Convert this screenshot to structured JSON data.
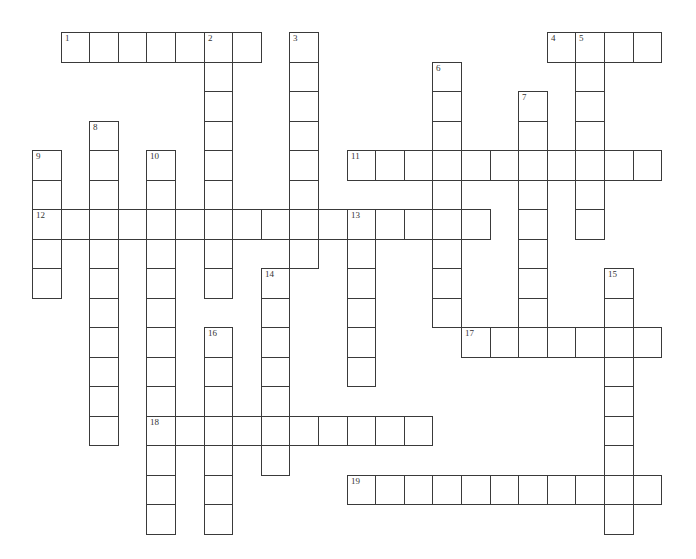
{
  "puzzle": {
    "title": "",
    "grid": {
      "origin_x": 32,
      "origin_y": 32,
      "cell_w": 28.6,
      "cell_h": 29.5,
      "line_color": "#3a3a3a",
      "cell_fill": "#ffffff"
    },
    "words": [
      {
        "number": "1",
        "direction": "across",
        "row": 0,
        "col": 1,
        "length": 7
      },
      {
        "number": "2",
        "direction": "down",
        "row": 0,
        "col": 6,
        "length": 9
      },
      {
        "number": "3",
        "direction": "down",
        "row": 0,
        "col": 9,
        "length": 8
      },
      {
        "number": "4",
        "direction": "across",
        "row": 0,
        "col": 18,
        "length": 4
      },
      {
        "number": "5",
        "direction": "down",
        "row": 0,
        "col": 19,
        "length": 7
      },
      {
        "number": "6",
        "direction": "down",
        "row": 1,
        "col": 14,
        "length": 9
      },
      {
        "number": "7",
        "direction": "down",
        "row": 2,
        "col": 17,
        "length": 8
      },
      {
        "number": "8",
        "direction": "down",
        "row": 3,
        "col": 2,
        "length": 11
      },
      {
        "number": "9",
        "direction": "down",
        "row": 4,
        "col": 0,
        "length": 5
      },
      {
        "number": "10",
        "direction": "down",
        "row": 4,
        "col": 4,
        "length": 13
      },
      {
        "number": "11",
        "direction": "across",
        "row": 4,
        "col": 11,
        "length": 11
      },
      {
        "number": "12",
        "direction": "across",
        "row": 6,
        "col": 0,
        "length": 16
      },
      {
        "number": "13",
        "direction": "down",
        "row": 6,
        "col": 11,
        "length": 6
      },
      {
        "number": "14",
        "direction": "down",
        "row": 8,
        "col": 8,
        "length": 7
      },
      {
        "number": "15",
        "direction": "down",
        "row": 8,
        "col": 20,
        "length": 9
      },
      {
        "number": "16",
        "direction": "down",
        "row": 10,
        "col": 6,
        "length": 7
      },
      {
        "number": "17",
        "direction": "across",
        "row": 10,
        "col": 15,
        "length": 7
      },
      {
        "number": "18",
        "direction": "across",
        "row": 13,
        "col": 4,
        "length": 10
      },
      {
        "number": "19",
        "direction": "across",
        "row": 15,
        "col": 11,
        "length": 11
      }
    ]
  }
}
